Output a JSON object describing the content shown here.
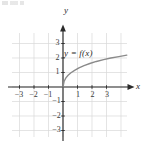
{
  "figure": {
    "kind": "cartesian-graph",
    "curve_label": "y = f(x)",
    "axis_x_label": "x",
    "axis_y_label": "y",
    "colors": {
      "grid": "#d9d9d9",
      "axis": "#2b2b2b",
      "curve": "#8a8a8a",
      "text": "#2b2b2b",
      "background": "#ffffff"
    }
  },
  "chart_data": {
    "type": "line",
    "title": "",
    "xlabel": "x",
    "ylabel": "y",
    "xlim": [
      -3.5,
      4.4
    ],
    "ylim": [
      -3.7,
      3.7
    ],
    "grid": true,
    "legend": "none",
    "annotations": [
      {
        "text": "y = f(x)",
        "x": 0.1,
        "y": 2.6
      }
    ],
    "xticks": [
      -3,
      -2,
      -1,
      1,
      2,
      3
    ],
    "xtick_labels": [
      "-3",
      "-2",
      "-1",
      "1",
      "2",
      "3"
    ],
    "yticks": [
      -3,
      -2,
      -1,
      1,
      2,
      3
    ],
    "ytick_labels": [
      "-3",
      "-2",
      "-1",
      "1",
      "2",
      "3"
    ],
    "series": [
      {
        "name": "y = f(x)",
        "color": "#8a8a8a",
        "x": [
          0,
          0.08,
          0.2,
          0.35,
          0.55,
          0.8,
          1.1,
          1.45,
          1.85,
          2.3,
          2.8,
          3.3,
          3.85,
          4.4
        ],
        "y": [
          0,
          0.4,
          0.63,
          0.81,
          0.98,
          1.15,
          1.32,
          1.48,
          1.62,
          1.76,
          1.89,
          2.0,
          2.1,
          2.2
        ]
      }
    ]
  }
}
